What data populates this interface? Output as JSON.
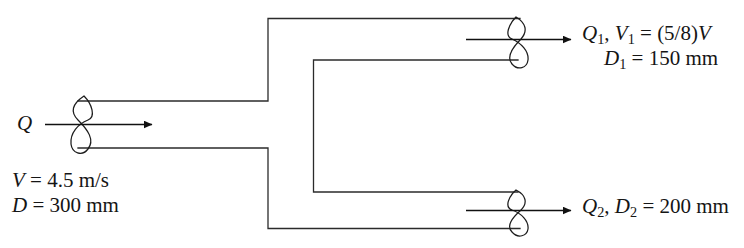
{
  "diagram": {
    "line_color": "#2b2b2b",
    "text_color": "#151515",
    "background": "#ffffff",
    "inlet": {
      "flow_label": "Q",
      "velocity_symbol": "V",
      "velocity_equals": "=",
      "velocity_value": "4.5",
      "velocity_unit": "m/s",
      "diameter_symbol": "D",
      "diameter_equals": "=",
      "diameter_value": "300",
      "diameter_unit": "mm"
    },
    "branch_top": {
      "flow_label": "Q",
      "flow_sub": "1",
      "separator": ", ",
      "velocity_symbol": "V",
      "velocity_sub": "1",
      "velocity_equals": "=",
      "velocity_expression": "(5/8)",
      "velocity_reference": "V",
      "diameter_symbol": "D",
      "diameter_sub": "1",
      "diameter_equals": "=",
      "diameter_value": "150",
      "diameter_unit": "mm"
    },
    "branch_bottom": {
      "flow_label": "Q",
      "flow_sub": "2",
      "separator": ", ",
      "diameter_symbol": "D",
      "diameter_sub": "2",
      "diameter_equals": "=",
      "diameter_value": "200",
      "diameter_unit": "mm"
    }
  }
}
